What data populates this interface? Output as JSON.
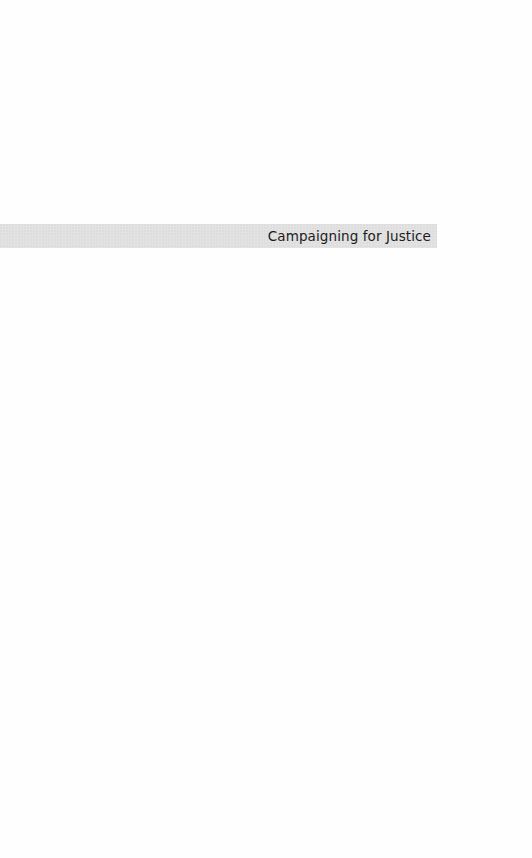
{
  "page": {
    "type": "half-title",
    "title": "Campaigning for Justice",
    "band_color": "#e3e3e3",
    "text_color": "#1c1c1c"
  }
}
